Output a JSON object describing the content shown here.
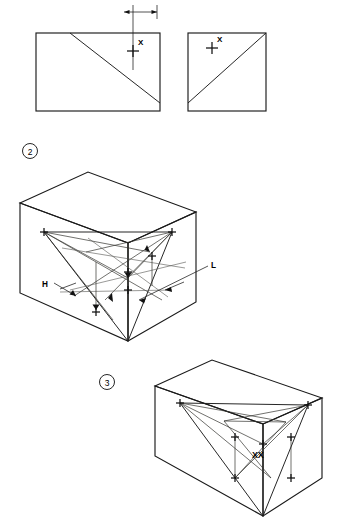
{
  "page": {
    "background": "#ffffff",
    "ink": "#1a1a1a",
    "width": 337,
    "height": 525
  },
  "figures": [
    {
      "id": "fig-2",
      "number": "2",
      "caption_marker": "circled-2",
      "marker_position": {
        "x": 30,
        "y": 151
      },
      "views": [
        {
          "id": "front-view",
          "name": "front-elevation-rectangle",
          "shape": "rectangle",
          "x": 36,
          "y": 33,
          "width": 124,
          "height": 78,
          "diagonal": {
            "from": [
              70,
              33
            ],
            "to": [
              160,
              103
            ]
          },
          "point_label": "X",
          "point_marker": {
            "x": 133,
            "y": 51,
            "type": "cross"
          },
          "label_offset": {
            "dx": 5,
            "dy": -5
          }
        },
        {
          "id": "side-view",
          "name": "side-elevation-square",
          "shape": "rectangle",
          "x": 188,
          "y": 33,
          "width": 78,
          "height": 78,
          "diagonal": {
            "from": [
              188,
              103
            ],
            "to": [
              266,
              33
            ]
          },
          "point_label": "X",
          "point_marker": {
            "x": 212,
            "y": 48,
            "type": "cross"
          },
          "label_offset": {
            "dx": 5,
            "dy": -5
          }
        }
      ],
      "dimensions": [
        {
          "label": "H",
          "label_position": {
            "x": 113,
            "y": 12
          },
          "line_y": 12,
          "from_x": 124,
          "to_x": 157,
          "extension_lines": [
            {
              "x": 133,
              "y1": 6,
              "y2": 70
            },
            {
              "x": 157,
              "y1": 6,
              "y2": 18
            }
          ]
        }
      ]
    },
    {
      "id": "fig-3",
      "number": "3",
      "caption_marker": "circled-3",
      "marker_position": {
        "x": 107,
        "y": 382
      },
      "views": [
        {
          "id": "iso-upper",
          "name": "isometric-box-upper",
          "labels": [
            {
              "text": "H",
              "x": 44,
              "y": 285,
              "leader_to": [
                73,
                294
              ]
            },
            {
              "text": "L",
              "x": 213,
              "y": 265,
              "leader_to": [
                140,
                299
              ]
            }
          ]
        },
        {
          "id": "iso-lower",
          "name": "isometric-box-lower",
          "labels": [
            {
              "text": "XX",
              "x": 252,
              "y": 455
            }
          ]
        }
      ]
    }
  ],
  "annotations": {
    "dimension_label_h": "H",
    "dimension_label_l": "L",
    "point_label_x": "X",
    "point_label_xx": "XX",
    "figure_number_2": "2",
    "figure_number_3": "3"
  }
}
